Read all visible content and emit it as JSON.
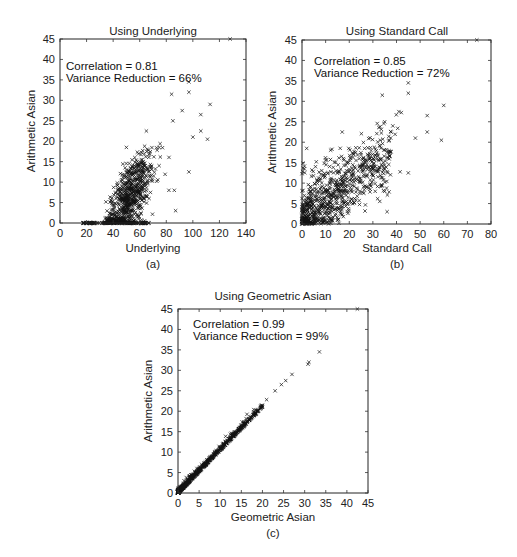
{
  "chart_data": [
    {
      "id": "a",
      "type": "scatter",
      "title": "Using Underlying",
      "xlabel": "Underlying",
      "ylabel": "Arithmetic Asian",
      "sublabel": "(a)",
      "annotations": [
        "Correlation = 0.81",
        "Variance Reduction = 66%"
      ],
      "correlation": 0.81,
      "variance_reduction_pct": 66,
      "xlim": [
        0,
        140
      ],
      "ylim": [
        0,
        45
      ],
      "xticks": [
        0,
        20,
        40,
        60,
        80,
        100,
        120,
        140
      ],
      "yticks": [
        0,
        5,
        10,
        15,
        20,
        25,
        30,
        35,
        40,
        45
      ],
      "grid": false,
      "marker": "x",
      "notable_points": [
        {
          "x": 128,
          "y": 45
        },
        {
          "x": 97,
          "y": 34.5
        },
        {
          "x": 97,
          "y": 32
        },
        {
          "x": 84,
          "y": 31.5
        },
        {
          "x": 113,
          "y": 29
        },
        {
          "x": 92,
          "y": 27.5
        },
        {
          "x": 106,
          "y": 26.5
        },
        {
          "x": 85,
          "y": 25
        },
        {
          "x": 106,
          "y": 22.5
        },
        {
          "x": 65,
          "y": 22.5
        },
        {
          "x": 111,
          "y": 20.5
        },
        {
          "x": 100,
          "y": 21
        },
        {
          "x": 97,
          "y": 12.5
        },
        {
          "x": 82,
          "y": 8
        },
        {
          "x": 86,
          "y": 8
        },
        {
          "x": 87,
          "y": 3
        },
        {
          "x": 50,
          "y": 18.5
        },
        {
          "x": 49,
          "y": 13.5
        },
        {
          "x": 42,
          "y": 7.5
        }
      ],
      "distribution": {
        "zero_cluster_x_range": [
          17,
          67
        ],
        "main_cluster_x_range": [
          35,
          100
        ],
        "n_points_approx": 900
      }
    },
    {
      "id": "b",
      "type": "scatter",
      "title": "Using Standard Call",
      "xlabel": "Standard Call",
      "ylabel": "Arithmetic Asian",
      "sublabel": "(b)",
      "annotations": [
        "Correlation = 0.85",
        "Variance Reduction = 72%"
      ],
      "correlation": 0.85,
      "variance_reduction_pct": 72,
      "xlim": [
        0,
        80
      ],
      "ylim": [
        0,
        45
      ],
      "xticks": [
        0,
        10,
        20,
        30,
        40,
        50,
        60,
        70,
        80
      ],
      "yticks": [
        0,
        5,
        10,
        15,
        20,
        25,
        30,
        35,
        40,
        45
      ],
      "grid": false,
      "marker": "x",
      "notable_points": [
        {
          "x": 74,
          "y": 45
        },
        {
          "x": 45,
          "y": 34.5
        },
        {
          "x": 45,
          "y": 32
        },
        {
          "x": 34,
          "y": 31.5
        },
        {
          "x": 60,
          "y": 29
        },
        {
          "x": 41,
          "y": 27.5
        },
        {
          "x": 53,
          "y": 26.5
        },
        {
          "x": 35,
          "y": 25
        },
        {
          "x": 53,
          "y": 22.5
        },
        {
          "x": 17,
          "y": 22.5
        },
        {
          "x": 59,
          "y": 20.5
        },
        {
          "x": 48,
          "y": 21
        },
        {
          "x": 45,
          "y": 12.5
        },
        {
          "x": 31,
          "y": 8
        },
        {
          "x": 35,
          "y": 8
        },
        {
          "x": 36,
          "y": 3
        },
        {
          "x": 2,
          "y": 18.5
        },
        {
          "x": 1,
          "y": 13.5
        }
      ],
      "distribution": {
        "main_cluster_x_range": [
          0,
          45
        ],
        "n_points_approx": 900
      }
    },
    {
      "id": "c",
      "type": "scatter",
      "title": "Using Geometric Asian",
      "xlabel": "Geometric Asian",
      "ylabel": "Arithmetic Asian",
      "sublabel": "(c)",
      "annotations": [
        "Correlation = 0.99",
        "Variance Reduction = 99%"
      ],
      "correlation": 0.99,
      "variance_reduction_pct": 99,
      "xlim": [
        0,
        45
      ],
      "ylim": [
        0,
        45
      ],
      "xticks": [
        0,
        5,
        10,
        15,
        20,
        25,
        30,
        35,
        40,
        45
      ],
      "yticks": [
        0,
        5,
        10,
        15,
        20,
        25,
        30,
        35,
        40,
        45
      ],
      "grid": false,
      "marker": "x",
      "notable_points": [
        {
          "x": 42.5,
          "y": 45
        },
        {
          "x": 33.5,
          "y": 34.5
        },
        {
          "x": 31,
          "y": 32
        },
        {
          "x": 30.8,
          "y": 31.5
        },
        {
          "x": 27,
          "y": 29
        },
        {
          "x": 25.5,
          "y": 27.5
        },
        {
          "x": 24.5,
          "y": 26.5
        },
        {
          "x": 23,
          "y": 25
        },
        {
          "x": 20,
          "y": 21
        }
      ],
      "distribution": {
        "relation": "y ≈ 1.05·x",
        "n_points_approx": 900
      }
    }
  ]
}
